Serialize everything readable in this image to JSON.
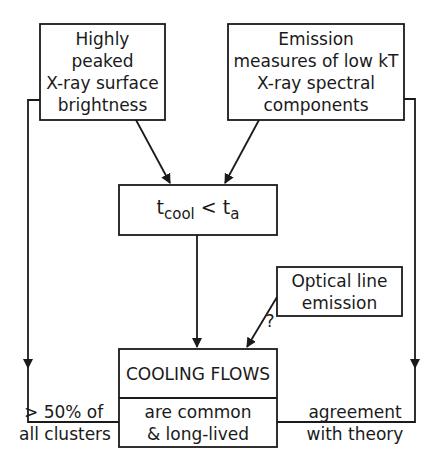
{
  "nodes": {
    "surface_brightness": {
      "lines": [
        "Highly",
        "peaked",
        "X-ray surface",
        "brightness"
      ]
    },
    "emission_measures": {
      "lines": [
        "Emission",
        "measures of low kT",
        "X-ray spectral",
        "components"
      ]
    },
    "timescale": {
      "t": "t",
      "cool": "cool",
      "lt": " < ",
      "t2": "t",
      "a": "a"
    },
    "optical": {
      "lines": [
        "Optical line",
        "emission"
      ]
    },
    "cooling_flows": {
      "title": "COOLING FLOWS",
      "lines": [
        "are  common",
        "&  long-lived"
      ]
    }
  },
  "edge_labels": {
    "question": "?",
    "left": [
      "> 50% of",
      "all clusters"
    ],
    "right": [
      "agreement",
      "with theory"
    ]
  }
}
